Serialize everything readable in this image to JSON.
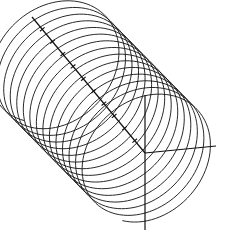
{
  "figure": {
    "title": "",
    "canvas": {
      "width": 228,
      "height": 243,
      "background": "#ffffff"
    },
    "stroke_color": "#111111",
    "helix": {
      "turns": 15,
      "samples_per_turn": 90,
      "start_center": [
        52,
        60
      ],
      "end_center": [
        150,
        160
      ],
      "u_vector": [
        62,
        -6
      ],
      "v_vector": [
        -8,
        62
      ],
      "phase_start": 1.9
    },
    "axes": [
      {
        "name": "diagonal-axis",
        "from": [
          32,
          17
        ],
        "to": [
          145,
          153
        ],
        "ticks": 10
      },
      {
        "name": "horizontal-axis",
        "from": [
          145,
          153
        ],
        "to": [
          216,
          146
        ],
        "ticks": 0
      },
      {
        "name": "vertical-axis",
        "from": [
          145,
          95
        ],
        "to": [
          145,
          230
        ],
        "ticks": 0
      }
    ],
    "tick_length": 6
  }
}
